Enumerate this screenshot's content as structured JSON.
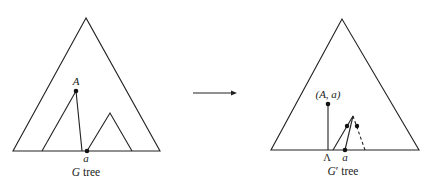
{
  "diagram": {
    "left_tree": {
      "caption_var": "G",
      "caption_text": " tree",
      "node_A_label": "A",
      "node_a_label": "a"
    },
    "arrow": {
      "direction": "right"
    },
    "right_tree": {
      "caption_var": "G",
      "caption_prime": "′",
      "caption_text": " tree",
      "node_Aa_label": "(A, a)",
      "lambda_label": "Λ",
      "node_a_label": "a"
    }
  }
}
